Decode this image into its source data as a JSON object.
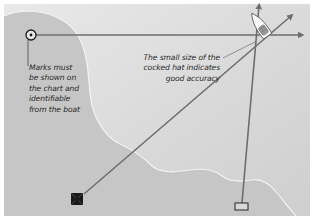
{
  "diagram": {
    "type": "navigation fix (three-point bearing / cocked hat)",
    "colors": {
      "sea": "#dcdcdc",
      "land": "#c4c4c4",
      "coastline": "#f2f2f2",
      "bearing_line": "#6e6e6e",
      "symbol": "#1a1a1a",
      "border": "#ffffff"
    },
    "marks": [
      {
        "name": "circle-dot-mark",
        "description": "landmark symbol (circle with dot)",
        "position": "top-left"
      },
      {
        "name": "maltese-cross-mark",
        "description": "church/cross chart symbol",
        "position": "bottom-left"
      },
      {
        "name": "rectangle-mark",
        "description": "building chart symbol",
        "position": "bottom-right"
      }
    ],
    "boat": {
      "description": "yacht at intersection of bearings",
      "position": "top-right"
    },
    "annotations": {
      "marks_note": {
        "lines": [
          "Marks must",
          "be shown on",
          "the chart and",
          "identifiable",
          "from the boat"
        ]
      },
      "cocked_hat_note": {
        "lines": [
          "The small size of the",
          "cocked hat indicates",
          "good accuracy"
        ]
      }
    }
  }
}
